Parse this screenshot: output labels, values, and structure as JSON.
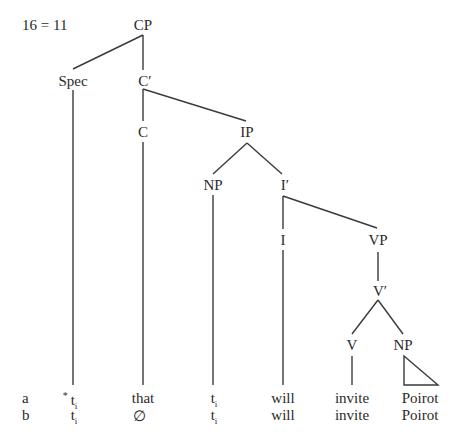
{
  "figure": {
    "label": "16 = 11"
  },
  "tree": {
    "nodes": {
      "cp": "CP",
      "spec": "Spec",
      "c_bar": "C′",
      "c": "C",
      "ip": "IP",
      "np_subj": "NP",
      "i_bar": "I′",
      "i": "I",
      "vp": "VP",
      "v_bar": "V′",
      "v": "V",
      "np_obj": "NP"
    }
  },
  "rows": [
    {
      "key": "a",
      "cells": [
        {
          "star": "*",
          "text": "t",
          "sub": "i"
        },
        {
          "text": "that"
        },
        {
          "text": "t",
          "sub": "i"
        },
        {
          "text": "will"
        },
        {
          "text": "invite"
        },
        {
          "text": "Poirot"
        }
      ]
    },
    {
      "key": "b",
      "cells": [
        {
          "text": "t",
          "sub": "i"
        },
        {
          "text": "∅"
        },
        {
          "text": "t",
          "sub": "i"
        },
        {
          "text": "will"
        },
        {
          "text": "invite"
        },
        {
          "text": "Poirot"
        }
      ]
    }
  ]
}
